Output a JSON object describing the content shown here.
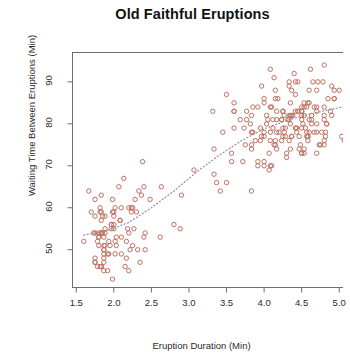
{
  "chart_data": {
    "type": "scatter",
    "title": "Old Faithful Eruptions",
    "xlabel": "Eruption Duration (Min)",
    "ylabel": "Waiting Time Between Eruptions (Min)",
    "xlim": [
      1.45,
      5.15
    ],
    "ylim": [
      41,
      97
    ],
    "xticks": [
      1.5,
      2.0,
      2.5,
      3.0,
      3.5,
      4.0,
      4.5,
      5.0
    ],
    "xtick_labels": [
      "1.5",
      "2.0",
      "2.5",
      "3.0",
      "3.5",
      "4.0",
      "4.5",
      "5.0"
    ],
    "yticks": [
      50,
      60,
      70,
      80,
      90
    ],
    "ytick_labels": [
      "50",
      "60",
      "70",
      "80",
      "90"
    ],
    "grid": false,
    "legend": null,
    "marker": "open-circle",
    "marker_color": "#c0705f",
    "marker_size": 4.4,
    "trendline": {
      "style": "dotted",
      "color": "#8e8fa8",
      "points": [
        [
          1.6,
          53.5
        ],
        [
          1.9,
          54.5
        ],
        [
          2.2,
          56.5
        ],
        [
          2.5,
          60.0
        ],
        [
          2.8,
          64.0
        ],
        [
          3.1,
          68.5
        ],
        [
          3.4,
          72.5
        ],
        [
          3.7,
          76.0
        ],
        [
          4.0,
          78.8
        ],
        [
          4.3,
          80.8
        ],
        [
          4.6,
          82.3
        ],
        [
          4.9,
          83.5
        ],
        [
          5.1,
          84.2
        ]
      ]
    },
    "x": [
      3.6,
      1.8,
      3.333,
      2.283,
      4.533,
      2.883,
      4.7,
      3.6,
      1.95,
      4.35,
      1.833,
      3.917,
      4.2,
      1.75,
      4.7,
      2.167,
      1.75,
      4.8,
      1.6,
      4.25,
      1.8,
      1.75,
      3.45,
      3.067,
      4.533,
      3.6,
      1.967,
      4.083,
      3.85,
      4.433,
      4.3,
      4.467,
      3.367,
      4.033,
      3.833,
      2.017,
      1.867,
      4.833,
      1.833,
      4.783,
      4.35,
      1.883,
      4.567,
      1.75,
      4.533,
      3.317,
      3.833,
      2.1,
      4.633,
      2.0,
      4.8,
      4.716,
      1.833,
      4.833,
      1.733,
      4.883,
      3.717,
      1.667,
      4.567,
      4.317,
      2.233,
      4.5,
      1.75,
      4.8,
      1.817,
      4.4,
      4.167,
      4.7,
      2.067,
      4.7,
      4.033,
      1.967,
      4.5,
      4.0,
      1.983,
      5.067,
      2.017,
      4.567,
      3.883,
      3.6,
      4.133,
      4.333,
      4.1,
      2.633,
      4.067,
      4.933,
      3.95,
      4.517,
      2.167,
      4.0,
      2.2,
      4.333,
      1.867,
      4.817,
      1.833,
      4.3,
      4.667,
      3.75,
      1.867,
      4.9,
      2.483,
      4.367,
      2.1,
      4.5,
      4.05,
      1.867,
      4.7,
      1.783,
      4.85,
      3.683,
      4.733,
      2.3,
      4.9,
      4.417,
      1.7,
      4.633,
      2.317,
      4.6,
      1.817,
      4.417,
      2.617,
      4.067,
      4.25,
      1.967,
      4.6,
      3.767,
      1.917,
      4.5,
      2.267,
      4.65,
      1.867,
      4.167,
      2.8,
      4.333,
      1.833,
      4.383,
      1.883,
      4.933,
      2.033,
      3.733,
      4.233,
      2.233,
      4.533,
      4.817,
      4.333,
      1.983,
      4.633,
      2.017,
      5.1,
      1.8,
      5.033,
      4.0,
      2.4,
      4.6,
      3.567,
      4.0,
      4.5,
      4.083,
      1.8,
      3.967,
      2.2,
      4.15,
      2.0,
      3.833,
      3.5,
      4.583,
      2.367,
      5.0,
      1.933,
      4.617,
      1.917,
      2.083,
      4.583,
      3.333,
      4.167,
      4.333,
      4.5,
      2.417,
      4.0,
      4.167,
      1.883,
      4.583,
      4.25,
      3.767,
      2.033,
      4.433,
      4.083,
      1.833,
      4.417,
      2.183,
      4.8,
      1.833,
      4.8,
      4.1,
      3.966,
      4.233,
      3.5,
      4.366,
      2.25,
      4.667,
      2.1,
      4.35,
      4.133,
      1.867,
      4.6,
      1.783,
      4.367,
      3.85,
      1.933,
      4.5,
      2.383,
      4.7,
      1.867,
      3.833,
      3.417,
      4.233,
      2.4,
      4.8,
      2.0,
      4.15,
      1.867,
      4.267,
      1.75,
      4.483,
      4.0,
      4.117,
      4.083,
      4.267,
      3.917,
      4.55,
      4.083,
      2.417,
      4.183,
      2.217,
      4.45,
      1.883,
      1.85,
      4.283,
      3.95,
      2.333,
      4.15,
      2.35,
      4.933,
      2.9,
      4.583,
      3.833,
      2.083,
      4.367,
      2.133,
      4.35,
      2.2,
      4.45,
      3.567,
      4.5,
      4.15,
      3.817,
      3.917,
      4.45,
      2.0,
      4.283,
      4.767,
      4.533,
      1.85,
      4.25,
      1.983,
      2.25,
      4.75,
      4.117,
      2.15,
      4.417,
      1.817,
      4.467
    ],
    "y": [
      79,
      54,
      74,
      62,
      85,
      55,
      88,
      85,
      51,
      85,
      54,
      84,
      78,
      47,
      83,
      52,
      62,
      84,
      52,
      79,
      51,
      47,
      78,
      69,
      74,
      83,
      55,
      76,
      78,
      79,
      73,
      77,
      66,
      80,
      74,
      52,
      48,
      80,
      59,
      90,
      80,
      58,
      84,
      58,
      73,
      83,
      64,
      53,
      82,
      59,
      75,
      90,
      54,
      80,
      54,
      83,
      71,
      64,
      77,
      81,
      59,
      84,
      48,
      82,
      60,
      92,
      78,
      78,
      65,
      73,
      82,
      56,
      79,
      71,
      62,
      76,
      60,
      78,
      76,
      83,
      75,
      82,
      70,
      65,
      73,
      88,
      76,
      80,
      48,
      86,
      60,
      90,
      50,
      78,
      63,
      72,
      84,
      75,
      51,
      82,
      62,
      88,
      49,
      83,
      81,
      47,
      84,
      52,
      86,
      81,
      75,
      59,
      89,
      79,
      59,
      81,
      50,
      85,
      59,
      87,
      53,
      69,
      77,
      56,
      88,
      81,
      45,
      82,
      55,
      90,
      45,
      83,
      56,
      89,
      46,
      82,
      51,
      86,
      53,
      79,
      81,
      60,
      82,
      77,
      76,
      59,
      80,
      49,
      96,
      53,
      77,
      77,
      65,
      81,
      71,
      70,
      81,
      93,
      53,
      89,
      45,
      86,
      58,
      78,
      66,
      76,
      63,
      88,
      52,
      93,
      49,
      57,
      77,
      68,
      81,
      81,
      73,
      50,
      85,
      74,
      55,
      77,
      83,
      83,
      51,
      78,
      84,
      46,
      83,
      55,
      81,
      57,
      76,
      84,
      77,
      81,
      87,
      77,
      51,
      78,
      60,
      82,
      91,
      53,
      78,
      46,
      77,
      84,
      49,
      83,
      71,
      80,
      49,
      75,
      64,
      76,
      53,
      94,
      55,
      76,
      50,
      82,
      54,
      75,
      78,
      79,
      78,
      78,
      70,
      79,
      70,
      54,
      86,
      50,
      90,
      54,
      54,
      77,
      79,
      64,
      75,
      47,
      86,
      63,
      85,
      82,
      57,
      82,
      67,
      74,
      54,
      83,
      73,
      73,
      88,
      80,
      71,
      83,
      56,
      79,
      78,
      84,
      58,
      83,
      43,
      60,
      75,
      81,
      46,
      90,
      46,
      74
    ]
  },
  "axis": {
    "frame_color": "#6e6e6e",
    "tick_color": "#6e6e6e"
  }
}
